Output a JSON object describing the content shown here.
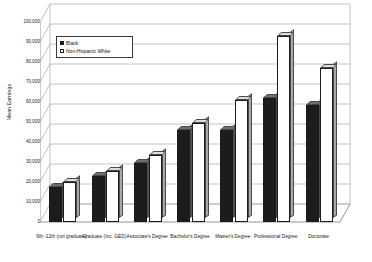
{
  "chart_data": {
    "type": "bar",
    "title": "",
    "xlabel": "",
    "ylabel": "Mean Earnings",
    "ylim": [
      0,
      100000
    ],
    "ytick_labels": [
      "100,000",
      "90,000",
      "80,000",
      "70,000",
      "60,000",
      "50,000",
      "40,000",
      "30,000",
      "20,000",
      "10,000",
      "0"
    ],
    "ytick_values": [
      100000,
      90000,
      80000,
      70000,
      60000,
      50000,
      40000,
      30000,
      20000,
      10000,
      0
    ],
    "grid": true,
    "legend_position": "upper-left-inside",
    "style": "3d-clustered-column",
    "categories": [
      "9th -12th (not graduate)",
      "Graduate (Inc. GED)",
      "Associate's Degree",
      "Bachelor's Degree",
      "Master's Degree",
      "Professional Degree",
      "Doctorate"
    ],
    "series": [
      {
        "name": "Black",
        "color": "#1c1c1c",
        "values": [
          17500,
          23000,
          29500,
          46000,
          46000,
          62000,
          58500
        ]
      },
      {
        "name": "Non-Hispanic White",
        "color": "#ffffff",
        "values": [
          20000,
          25500,
          33500,
          49500,
          61000,
          93000,
          77000
        ]
      }
    ]
  },
  "legend": {
    "items": [
      {
        "label": "Black",
        "swatch": "filled-square-icon"
      },
      {
        "label": "Non-Hispanic White",
        "swatch": "hollow-square-icon"
      }
    ]
  }
}
